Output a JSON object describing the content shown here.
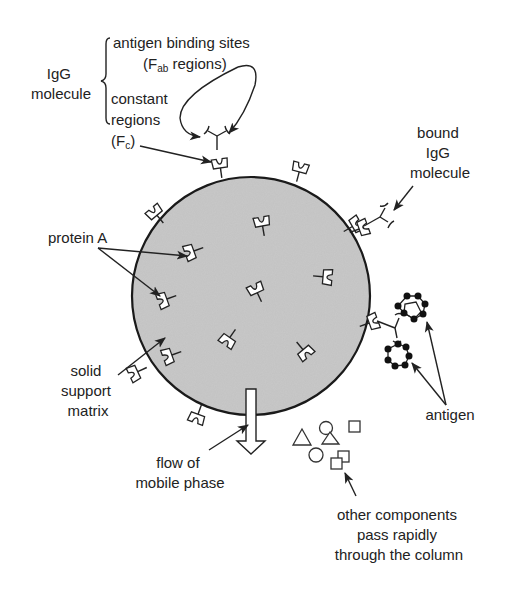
{
  "diagram": {
    "type": "affinity chromatography schematic (protein A column)",
    "labels": {
      "igg_molecule": [
        "IgG",
        "molecule"
      ],
      "antigen_binding_sites": "antigen binding sites",
      "fab_prefix": "(F",
      "fab_subscript": "ab",
      "fab_suffix": " regions)",
      "constant_regions": [
        "constant",
        "regions"
      ],
      "fc_prefix": "(F",
      "fc_subscript": "c",
      "fc_suffix": ")",
      "bound_igg": [
        "bound",
        "IgG",
        "molecule"
      ],
      "protein_a": "protein A",
      "solid_support": [
        "solid",
        "support",
        "matrix"
      ],
      "antigen": "antigen",
      "flow": [
        "flow of",
        "mobile phase"
      ],
      "other_components": [
        "other components",
        "pass rapidly",
        "through the column"
      ]
    },
    "colors": {
      "matrix_fill": "#c8c8c8",
      "stroke": "#222222",
      "background": "#ffffff"
    }
  }
}
